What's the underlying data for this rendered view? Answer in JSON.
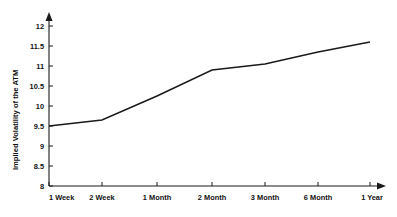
{
  "chart_data": {
    "type": "line",
    "title": "",
    "subtitle": "",
    "xlabel": "",
    "ylabel": "Implied Volatility of the ATM",
    "categories": [
      "1 Week",
      "2 Week",
      "1 Month",
      "2 Month",
      "3 Month",
      "6 Month",
      "1 Year"
    ],
    "values": [
      9.5,
      9.65,
      10.25,
      10.9,
      11.05,
      11.35,
      11.6
    ],
    "series": [
      {
        "name": "Implied Volatility of the ATM",
        "values": [
          9.5,
          9.65,
          10.25,
          10.9,
          11.05,
          11.35,
          11.6
        ]
      }
    ],
    "ylim": [
      8,
      12
    ],
    "xlim": [
      0,
      6
    ],
    "y_ticks": [
      8,
      8.5,
      9,
      9.5,
      10,
      10.5,
      11,
      11.5,
      12
    ],
    "y_tick_labels": [
      "8",
      "8.5",
      "9",
      "9.5",
      "10",
      "10.5",
      "11",
      "11.5",
      "12"
    ],
    "x_ticks": [
      0,
      1,
      2,
      3,
      4,
      5,
      6
    ],
    "x_tick_labels": [
      "1 Week",
      "2 Week",
      "1 Month",
      "2 Month",
      "3 Month",
      "6 Month",
      "1 Year"
    ],
    "grid": false,
    "legend": false,
    "legend_position": "none",
    "annotations": [],
    "line_color": "#1a1a1a",
    "axis_color": "#1a1a1a",
    "background_color": "#ffffff",
    "axis_arrows": true
  }
}
